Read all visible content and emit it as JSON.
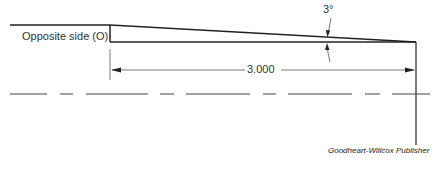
{
  "diagram": {
    "labels": {
      "opposite_side": "Opposite side (O)",
      "angle": "3°",
      "dimension": "3.000",
      "credit": "Goodheart-Willcox Publisher"
    },
    "colors": {
      "line": "#222222",
      "thin_line": "#555555",
      "text": "#333333"
    }
  }
}
